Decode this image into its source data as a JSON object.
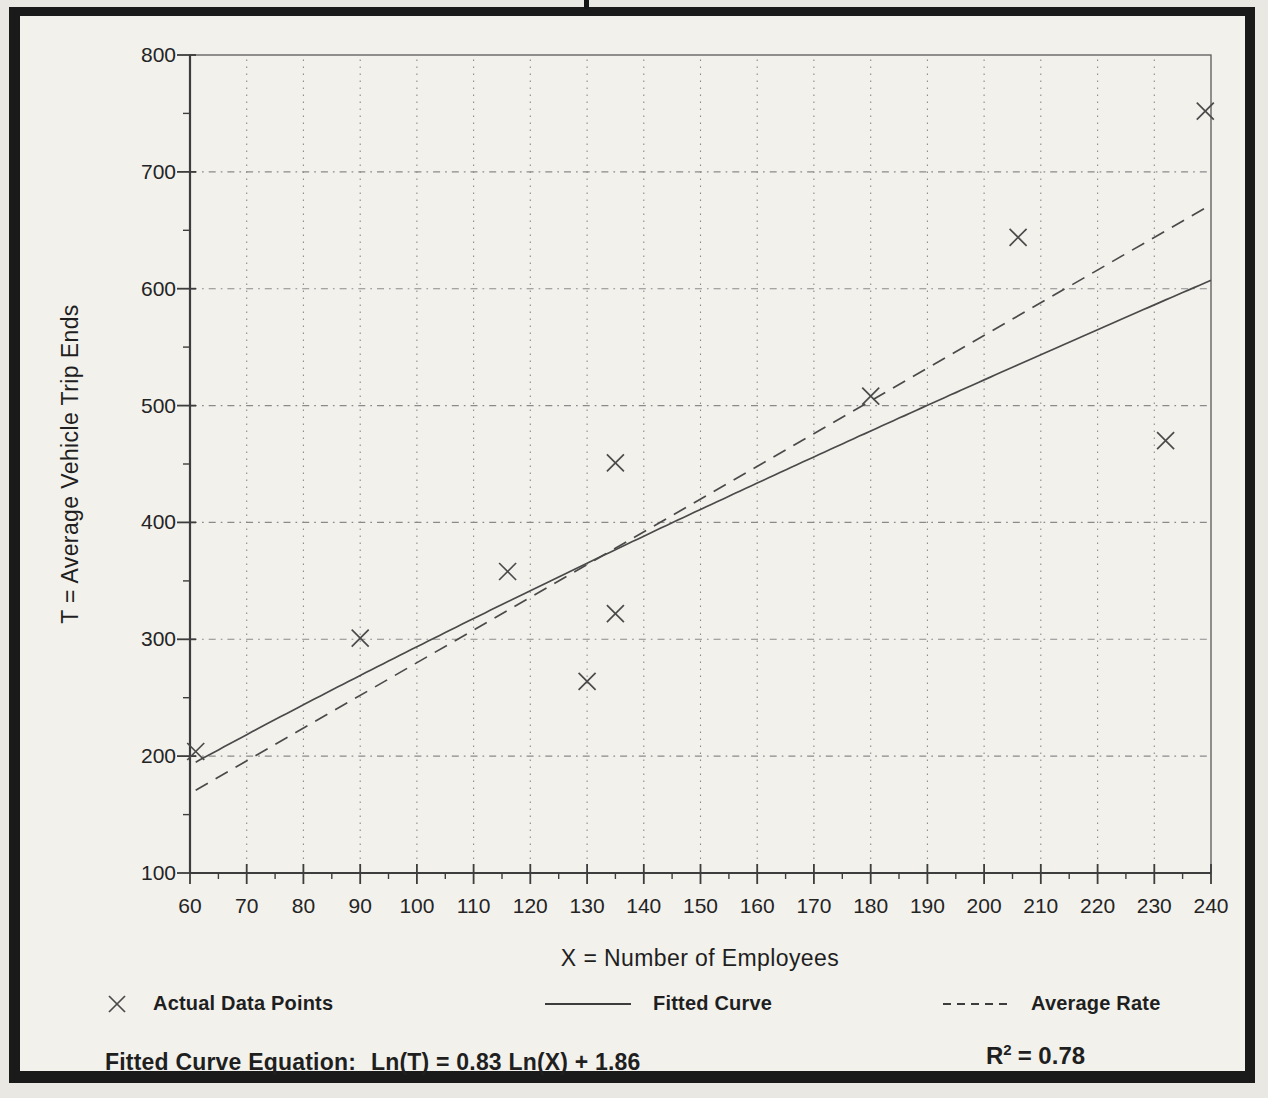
{
  "page": {
    "paper_color": "#e9e8e3",
    "inner_color": "#f2f1ec",
    "frame_color": "#1a1a1a",
    "ink_color": "#242424",
    "plot_line_color": "#4a4a4a",
    "axis_color": "#3d3d3d",
    "grid_color": "#8a8a8a"
  },
  "chart_data": {
    "type": "scatter",
    "title": "",
    "xlabel": "X = Number of Employees",
    "ylabel": "T = Average Vehicle Trip Ends",
    "xlim": [
      60,
      240
    ],
    "ylim": [
      100,
      800
    ],
    "x_ticks": [
      60,
      70,
      80,
      90,
      100,
      110,
      120,
      130,
      140,
      150,
      160,
      170,
      180,
      190,
      200,
      210,
      220,
      230,
      240
    ],
    "y_ticks": [
      100,
      200,
      300,
      400,
      500,
      600,
      700,
      800
    ],
    "x_minor_step": 5,
    "y_minor_step": 50,
    "grid": "both",
    "points": [
      [
        61,
        204
      ],
      [
        90,
        301
      ],
      [
        116,
        358
      ],
      [
        130,
        264
      ],
      [
        135,
        322
      ],
      [
        135,
        451
      ],
      [
        180,
        508
      ],
      [
        206,
        644
      ],
      [
        232,
        470
      ],
      [
        239,
        752
      ]
    ],
    "fitted_curve": {
      "ln_coefficient": 0.83,
      "ln_intercept": 1.86,
      "x_range": [
        61,
        240
      ]
    },
    "average_rate": {
      "rate": 2.8,
      "x_range": [
        61,
        240
      ]
    },
    "r_squared": 0.78,
    "legend": [
      {
        "icon": "x-marker-icon",
        "label": "Actual Data Points"
      },
      {
        "icon": "solid-line-icon",
        "label": "Fitted Curve"
      },
      {
        "icon": "dashed-line-icon",
        "label": "Average Rate"
      }
    ]
  },
  "footer": {
    "equation_prefix": "Fitted Curve Equation:",
    "equation_formula": "Ln(T) = 0.83 Ln(X) + 1.86",
    "r_squared_base": "R",
    "r_squared_exponent": "2",
    "r_squared_value": "= 0.78"
  }
}
